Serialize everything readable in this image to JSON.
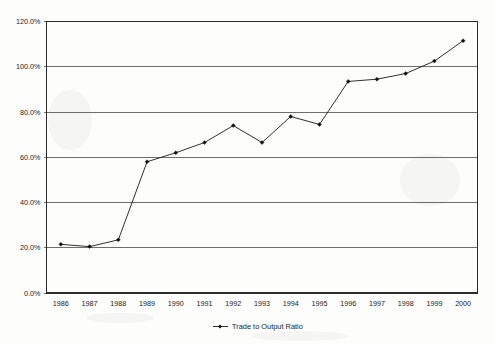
{
  "chart_data": {
    "type": "line",
    "title": "",
    "xlabel": "",
    "ylabel": "",
    "categories": [
      "1986",
      "1987",
      "1988",
      "1989",
      "1990",
      "1991",
      "1992",
      "1993",
      "1994",
      "1995",
      "1996",
      "1997",
      "1998",
      "1999",
      "2000"
    ],
    "series": [
      {
        "name": "Trade to Output Ratio",
        "values": [
          21.5,
          20.5,
          23.5,
          58.0,
          62.0,
          66.5,
          74.0,
          66.5,
          78.0,
          74.5,
          93.5,
          94.5,
          97.0,
          102.5,
          111.5
        ]
      }
    ],
    "ylim": [
      0,
      120
    ],
    "ytick_values": [
      0,
      20,
      40,
      60,
      80,
      100,
      120
    ],
    "ytick_labels": [
      "0.0%",
      "20.0%",
      "40.0%",
      "60.0%",
      "80.0%",
      "100.0%",
      "120.0%"
    ],
    "grid": "horizontal",
    "legend_position": "bottom",
    "marker": "diamond",
    "line_color": "#1a1a1a",
    "grid_color": "#4a4a4a",
    "background_color": "#fdfdfc"
  },
  "legend": {
    "entries": [
      {
        "label": "Trade to Output Ratio"
      }
    ]
  }
}
